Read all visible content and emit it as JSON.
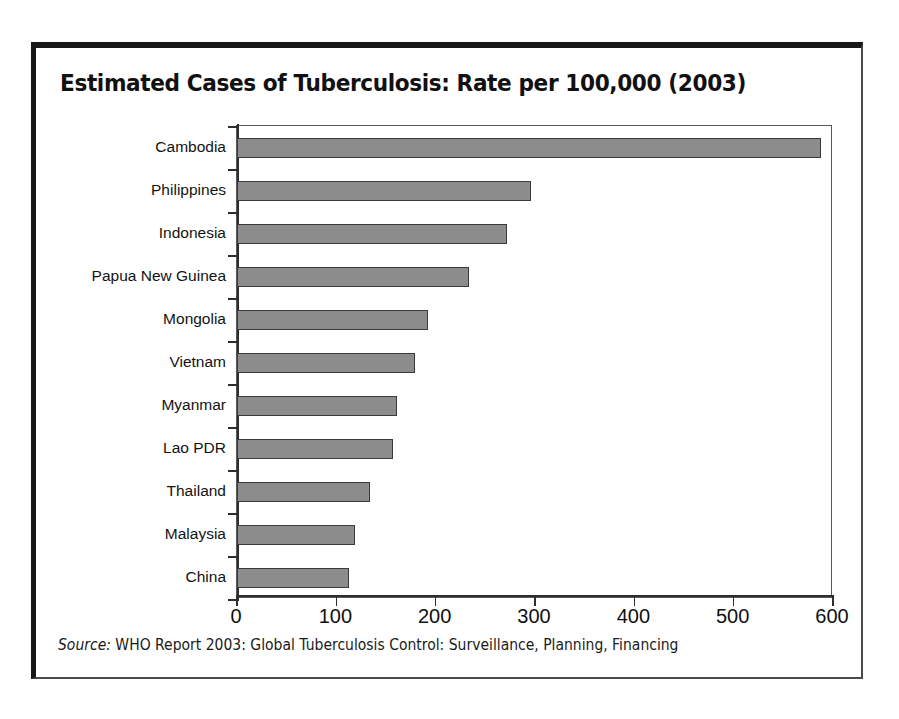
{
  "chart_data": {
    "type": "bar",
    "orientation": "horizontal",
    "title": "Estimated Cases of Tuberculosis: Rate per 100,000 (2003)",
    "xlabel": "",
    "ylabel": "",
    "xlim": [
      0,
      600
    ],
    "xticks": [
      0,
      100,
      200,
      300,
      400,
      500,
      600
    ],
    "xtick_labels": [
      "0",
      "100",
      "200",
      "300",
      "400",
      "500",
      "600"
    ],
    "grid": false,
    "legend": null,
    "categories": [
      "Cambodia",
      "Philippines",
      "Indonesia",
      "Papua New Guinea",
      "Mongolia",
      "Vietnam",
      "Myanmar",
      "Lao PDR",
      "Thailand",
      "Malaysia",
      "China"
    ],
    "values": [
      588,
      296,
      272,
      234,
      192,
      179,
      161,
      157,
      134,
      119,
      113
    ],
    "bar_color": "#8c8c8c",
    "bar_edge_color": "#3a3a3a",
    "source_prefix": "Source:",
    "source_text": " WHO Report 2003: Global Tuberculosis Control: Surveillance, Planning, Financing"
  },
  "figure": {
    "frame_color": "#171717",
    "plot_border_color": "#59595c",
    "background": "#ffffff"
  }
}
